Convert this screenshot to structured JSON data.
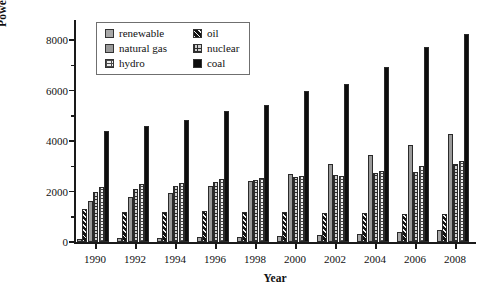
{
  "chart_data": {
    "type": "bar",
    "title": "",
    "xlabel": "Year",
    "ylabel": "Power production /TWh",
    "categories": [
      "1990",
      "1992",
      "1994",
      "1996",
      "1998",
      "2000",
      "2002",
      "2004",
      "2006",
      "2008"
    ],
    "ylim": [
      0,
      8800
    ],
    "yticks": [
      0,
      2000,
      4000,
      6000,
      8000
    ],
    "yticks_minor": [
      1000,
      3000,
      5000,
      7000
    ],
    "grid": false,
    "legend_position": "top-left-inside",
    "series": [
      {
        "name": "renewable",
        "key": "renewable",
        "color": "#a8a8a8",
        "values": [
          130,
          160,
          175,
          195,
          215,
          250,
          275,
          330,
          400,
          470
        ]
      },
      {
        "name": "oil",
        "key": "oil",
        "color": "#141414",
        "values": [
          1290,
          1200,
          1190,
          1230,
          1190,
          1180,
          1160,
          1160,
          1130,
          1110
        ]
      },
      {
        "name": "natural gas",
        "key": "natural_gas",
        "color": "#9a9a9a",
        "values": [
          1630,
          1800,
          1960,
          2230,
          2400,
          2700,
          3110,
          3440,
          3850,
          4280
        ]
      },
      {
        "name": "nuclear",
        "key": "nuclear",
        "color": "#cfcfcf",
        "values": [
          2000,
          2120,
          2230,
          2390,
          2450,
          2580,
          2650,
          2740,
          2790,
          3080
        ]
      },
      {
        "name": "hydro",
        "key": "hydro",
        "color": "#ededed",
        "values": [
          2180,
          2290,
          2350,
          2480,
          2540,
          2630,
          2610,
          2830,
          3020,
          3200
        ]
      },
      {
        "name": "coal",
        "key": "coal",
        "color": "#0d0d0d",
        "values": [
          4400,
          4580,
          4820,
          5210,
          5430,
          6000,
          6270,
          6920,
          7740,
          8240
        ]
      }
    ]
  },
  "legend": {
    "entries": [
      {
        "label": "renewable",
        "key": "renewable"
      },
      {
        "label": "oil",
        "key": "oil"
      },
      {
        "label": "natural gas",
        "key": "natural_gas"
      },
      {
        "label": "nuclear",
        "key": "nuclear"
      },
      {
        "label": "hydro",
        "key": "hydro"
      },
      {
        "label": "coal",
        "key": "coal"
      }
    ]
  }
}
